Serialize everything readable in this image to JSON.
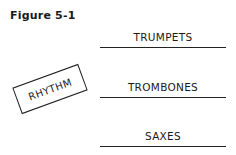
{
  "figure": {
    "title": "Figure 5-1"
  },
  "diagram": {
    "rhythm_label": "RHYTHM",
    "sections": [
      {
        "label": "TRUMPETS"
      },
      {
        "label": "TROMBONES"
      },
      {
        "label": "SAXES"
      }
    ]
  }
}
